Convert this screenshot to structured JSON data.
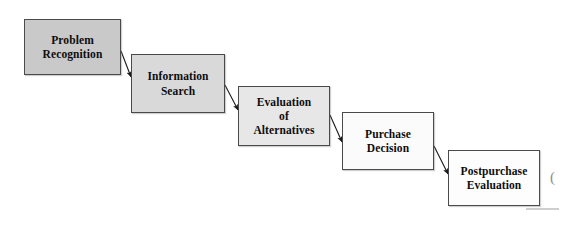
{
  "diagram": {
    "background_color": "#ffffff",
    "border_color": "#4a4a4a",
    "text_color": "#0d0d0d",
    "arrow_color": "#1a1a1a",
    "stages": [
      {
        "id": "problem-recognition",
        "label": "Problem\nRecognition",
        "lines": [
          "Problem",
          "Recognition"
        ],
        "order": 1,
        "fill": "#c9c9c9",
        "x": 24,
        "y": 19,
        "width": 97,
        "height": 56
      },
      {
        "id": "information-search",
        "label": "Information\nSearch",
        "lines": [
          "Information",
          "Search"
        ],
        "order": 2,
        "fill": "#d9d9d9",
        "x": 131,
        "y": 54,
        "width": 94,
        "height": 59
      },
      {
        "id": "evaluation-of-alternatives",
        "label": "Evaluation\nof\nAlternatives",
        "lines": [
          "Evaluation",
          "of",
          "Alternatives"
        ],
        "order": 3,
        "fill": "#e7e7e7",
        "x": 238,
        "y": 86,
        "width": 92,
        "height": 60
      },
      {
        "id": "purchase-decision",
        "label": "Purchase\nDecision",
        "lines": [
          "Purchase",
          "Decision"
        ],
        "order": 4,
        "fill": "#fbfbfb",
        "x": 342,
        "y": 112,
        "width": 92,
        "height": 58
      },
      {
        "id": "postpurchase-evaluation",
        "label": "Postpurchase\nEvaluation",
        "lines": [
          "Postpurchase",
          "Evaluation"
        ],
        "order": 5,
        "fill": "#fdfdfd",
        "x": 448,
        "y": 150,
        "width": 92,
        "height": 56
      }
    ],
    "connectors": [
      {
        "id": "arrow-1-to-2",
        "from": "problem-recognition",
        "to": "information-search",
        "x1": 121,
        "y1": 51,
        "x2": 131,
        "y2": 77
      },
      {
        "id": "arrow-2-to-3",
        "from": "information-search",
        "to": "evaluation-of-alternatives",
        "x1": 225,
        "y1": 85,
        "x2": 238,
        "y2": 110
      },
      {
        "id": "arrow-3-to-4",
        "from": "evaluation-of-alternatives",
        "to": "purchase-decision",
        "x1": 330,
        "y1": 115,
        "x2": 342,
        "y2": 142
      },
      {
        "id": "arrow-4-to-5",
        "from": "purchase-decision",
        "to": "postpurchase-evaluation",
        "x1": 434,
        "y1": 146,
        "x2": 448,
        "y2": 174
      }
    ],
    "edge_artifacts": {
      "clipped_glyph": "(",
      "glyph_x": 550,
      "glyph_y": 170,
      "rule_x": 526,
      "rule_y": 208,
      "rule_width": 33
    }
  }
}
